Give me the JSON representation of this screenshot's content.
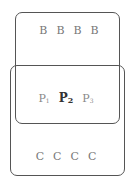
{
  "diagram": {
    "top_box": {
      "label": "upper region",
      "letters": [
        "B",
        "B",
        "B",
        "B"
      ]
    },
    "bottom_box": {
      "label": "lower region",
      "letters": [
        "C",
        "C",
        "C",
        "C"
      ]
    },
    "overlap": {
      "items": [
        {
          "base": "P",
          "sub": "1",
          "bold": false
        },
        {
          "base": "P",
          "sub": "2",
          "bold": true
        },
        {
          "base": "P",
          "sub": "3",
          "bold": false
        }
      ]
    },
    "colors": {
      "border": "#555555",
      "text": "#777777",
      "bold_text": "#333333",
      "background": "#ffffff"
    }
  }
}
